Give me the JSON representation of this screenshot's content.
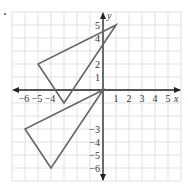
{
  "chart_data": {
    "type": "scatter",
    "title": "",
    "xlabel": "x",
    "ylabel": "y",
    "xlim": [
      -7,
      6
    ],
    "ylim": [
      -7,
      6
    ],
    "grid": true,
    "x_tick_labels": [
      "-6",
      "-5",
      "-4",
      "1",
      "2",
      "3",
      "4",
      "5"
    ],
    "y_tick_labels": [
      "5",
      "4",
      "2",
      "1",
      "-3",
      "-4",
      "-5",
      "-6"
    ],
    "series": [
      {
        "name": "triangle-upper",
        "shape": "polygon",
        "points": [
          [
            1,
            5
          ],
          [
            -5,
            2
          ],
          [
            -3,
            -1
          ]
        ]
      },
      {
        "name": "triangle-lower",
        "shape": "polygon",
        "points": [
          [
            0,
            0
          ],
          [
            -6,
            -3
          ],
          [
            -4,
            -6
          ]
        ]
      }
    ]
  },
  "style": {
    "grid_color": "#d9d9d9",
    "axis_color": "#222222",
    "triangle_color": "#666666",
    "label_color": "#333333"
  }
}
